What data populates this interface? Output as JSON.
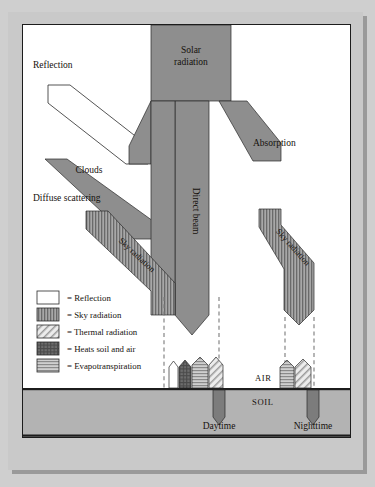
{
  "diagram": {
    "type": "flow-diagram",
    "colors": {
      "beam_gray": "#8e8e8e",
      "soil_gray": "#b3b3b3",
      "mat_gray": "#c9c9c9",
      "page_white": "#ffffff",
      "ink": "#15110d",
      "stripe_dark": "#6f6f6f",
      "hatch_light": "#d9d9d9"
    },
    "labels": {
      "solar_radiation": "Solar\nradiation",
      "solar_radiation_line1": "Solar",
      "solar_radiation_line2": "radiation",
      "reflection": "Reflection",
      "clouds": "Clouds",
      "absorption": "Absorption",
      "diffuse_scattering": "Diffuse scattering",
      "direct_beam": "Direct beam",
      "sky_radiation_left": "Sky radiation",
      "sky_radiation_right": "Sky radiation",
      "air": "AIR",
      "soil": "SOIL",
      "daytime": "Daytime",
      "nighttime": "Nighttime"
    },
    "legend": {
      "items": [
        {
          "pattern": "white",
          "label": "= Reflection"
        },
        {
          "pattern": "vertical",
          "label": "= Sky radiation"
        },
        {
          "pattern": "diagonal",
          "label": "= Thermal radiation"
        },
        {
          "pattern": "crosshatch",
          "label": "= Heats soil and air"
        },
        {
          "pattern": "horizontal",
          "label": "= Evapotranspiration"
        }
      ]
    },
    "daytime_fluxes": [
      {
        "pattern": "white",
        "name": "reflection",
        "direction": "up"
      },
      {
        "pattern": "crosshatch",
        "name": "heats-soil-and-air",
        "direction": "up"
      },
      {
        "pattern": "horizontal",
        "name": "evapotranspiration",
        "direction": "up"
      },
      {
        "pattern": "diagonal",
        "name": "thermal-radiation",
        "direction": "up"
      },
      {
        "pattern": "solid",
        "name": "into-soil",
        "direction": "down"
      }
    ],
    "nighttime_fluxes": [
      {
        "pattern": "horizontal",
        "name": "evapotranspiration",
        "direction": "up"
      },
      {
        "pattern": "diagonal",
        "name": "thermal-radiation",
        "direction": "up"
      },
      {
        "pattern": "solid",
        "name": "from-soil",
        "direction": "down"
      }
    ]
  }
}
